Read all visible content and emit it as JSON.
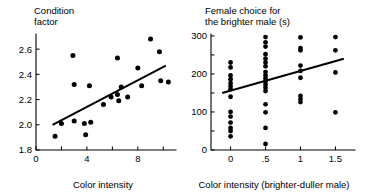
{
  "figure": {
    "background_color": "#ffffff",
    "ink_color": "#000000"
  },
  "chart_data": [
    {
      "id": "condition-factor",
      "type": "scatter",
      "title": "Condition factor",
      "title_line_1": "Condition",
      "title_line_2": "factor",
      "xlabel": "Color intensity",
      "ylabel": "Condition factor",
      "xlim": [
        0,
        11
      ],
      "ylim": [
        1.8,
        2.72
      ],
      "xticks": [
        0,
        4,
        8
      ],
      "xtick_labels": [
        "0",
        "4",
        "8"
      ],
      "xticks_minor": [
        2,
        6,
        10
      ],
      "yticks": [
        1.8,
        2.0,
        2.2,
        2.4,
        2.6
      ],
      "ytick_labels": [
        "1.8",
        "2.0",
        "2.2",
        "2.4",
        "2.6"
      ],
      "grid": false,
      "legend": null,
      "trendline": {
        "x": [
          1.3,
          10.2
        ],
        "y": [
          2.0,
          2.47
        ]
      },
      "points": [
        {
          "x": 1.5,
          "y": 1.91
        },
        {
          "x": 2.0,
          "y": 2.01
        },
        {
          "x": 2.9,
          "y": 2.55
        },
        {
          "x": 3.0,
          "y": 2.03
        },
        {
          "x": 3.8,
          "y": 2.01
        },
        {
          "x": 3.9,
          "y": 1.92
        },
        {
          "x": 3.0,
          "y": 2.32
        },
        {
          "x": 4.2,
          "y": 2.31
        },
        {
          "x": 4.3,
          "y": 2.02
        },
        {
          "x": 5.3,
          "y": 2.16
        },
        {
          "x": 5.9,
          "y": 2.22
        },
        {
          "x": 6.4,
          "y": 2.53
        },
        {
          "x": 6.4,
          "y": 2.24
        },
        {
          "x": 6.5,
          "y": 2.19
        },
        {
          "x": 6.7,
          "y": 2.3
        },
        {
          "x": 7.2,
          "y": 2.22
        },
        {
          "x": 8.0,
          "y": 2.45
        },
        {
          "x": 8.3,
          "y": 2.31
        },
        {
          "x": 9.0,
          "y": 2.68
        },
        {
          "x": 9.7,
          "y": 2.58
        },
        {
          "x": 9.8,
          "y": 2.35
        },
        {
          "x": 10.4,
          "y": 2.34
        }
      ]
    },
    {
      "id": "female-choice",
      "type": "scatter",
      "title": "Female choice for the brighter male (s)",
      "title_line_1": "Female choice for",
      "title_line_2": "the brighter male (s)",
      "xlabel": "Color intensity (brighter-duller male)",
      "ylabel": "Female choice for the brighter male (s)",
      "xlim": [
        -0.28,
        1.78
      ],
      "ylim": [
        0,
        305
      ],
      "xticks": [
        0,
        0.5,
        1,
        1.5
      ],
      "xtick_labels": [
        "0",
        ".5",
        "1",
        "1.5"
      ],
      "yticks": [
        0,
        100,
        200,
        300
      ],
      "ytick_labels": [
        "0",
        "100",
        "200",
        "300"
      ],
      "yticks_minor": [
        50,
        150,
        250
      ],
      "grid": false,
      "legend": null,
      "trendline": {
        "x": [
          -0.12,
          1.62
        ],
        "y": [
          150,
          240
        ]
      },
      "points": [
        {
          "x": 0.0,
          "y": 230
        },
        {
          "x": 0.0,
          "y": 217
        },
        {
          "x": 0.0,
          "y": 196
        },
        {
          "x": 0.0,
          "y": 186
        },
        {
          "x": 0.0,
          "y": 176
        },
        {
          "x": 0.0,
          "y": 168
        },
        {
          "x": 0.0,
          "y": 160
        },
        {
          "x": 0.0,
          "y": 140
        },
        {
          "x": 0.0,
          "y": 100
        },
        {
          "x": 0.0,
          "y": 88
        },
        {
          "x": 0.0,
          "y": 72
        },
        {
          "x": 0.0,
          "y": 58
        },
        {
          "x": 0.0,
          "y": 50
        },
        {
          "x": 0.0,
          "y": 36
        },
        {
          "x": 0.5,
          "y": 297
        },
        {
          "x": 0.5,
          "y": 283
        },
        {
          "x": 0.5,
          "y": 272
        },
        {
          "x": 0.5,
          "y": 252
        },
        {
          "x": 0.5,
          "y": 240
        },
        {
          "x": 0.5,
          "y": 230
        },
        {
          "x": 0.5,
          "y": 220
        },
        {
          "x": 0.5,
          "y": 205
        },
        {
          "x": 0.5,
          "y": 196
        },
        {
          "x": 0.5,
          "y": 188
        },
        {
          "x": 0.5,
          "y": 180
        },
        {
          "x": 0.5,
          "y": 172
        },
        {
          "x": 0.5,
          "y": 164
        },
        {
          "x": 0.5,
          "y": 155
        },
        {
          "x": 0.5,
          "y": 120
        },
        {
          "x": 0.5,
          "y": 99
        },
        {
          "x": 0.5,
          "y": 58
        },
        {
          "x": 0.5,
          "y": 16
        },
        {
          "x": 1.0,
          "y": 296
        },
        {
          "x": 1.0,
          "y": 268
        },
        {
          "x": 1.0,
          "y": 262
        },
        {
          "x": 1.0,
          "y": 222
        },
        {
          "x": 1.0,
          "y": 208
        },
        {
          "x": 1.0,
          "y": 190
        },
        {
          "x": 1.0,
          "y": 142
        },
        {
          "x": 1.0,
          "y": 134
        },
        {
          "x": 1.0,
          "y": 126
        },
        {
          "x": 1.5,
          "y": 297
        },
        {
          "x": 1.5,
          "y": 262
        },
        {
          "x": 1.5,
          "y": 204
        },
        {
          "x": 1.5,
          "y": 99
        }
      ]
    }
  ]
}
